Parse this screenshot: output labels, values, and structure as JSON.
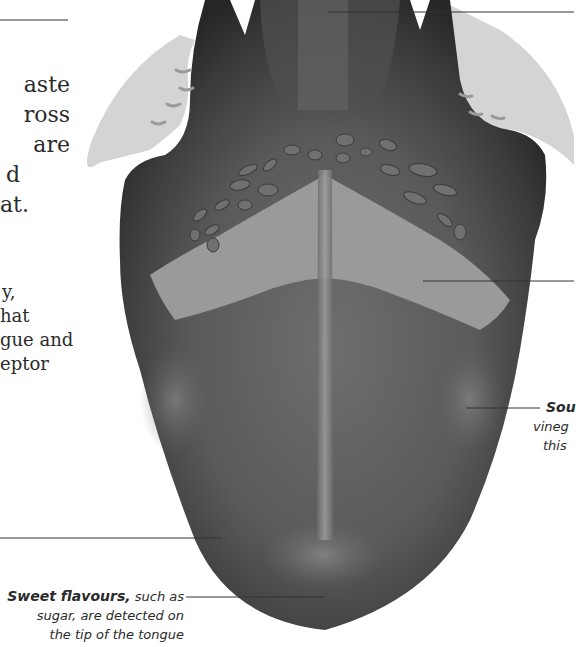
{
  "intro_paragraph": {
    "lines": [
      "aste",
      "ross",
      "are",
      "d",
      "at."
    ]
  },
  "second_paragraph": {
    "lines": [
      "y,",
      "hat",
      "gue and",
      "eptor"
    ]
  },
  "labels": {
    "sour": {
      "lines": [
        "Sou",
        "vineg",
        "this"
      ],
      "bold_term": "Sou"
    },
    "sweet": {
      "bold_term": "Sweet flavours,",
      "rest_line1": " such as",
      "line2": "sugar, are detected on",
      "line3": "the tip of the tongue"
    }
  },
  "illustration": {
    "subject": "tongue-diagram",
    "colors": {
      "tongue_dark": "#3a3a3a",
      "tongue_mid": "#5e5e5e",
      "bitter_zone": "#9a9a9a",
      "tonsil_light": "#d4d4d4",
      "leader_line": "#333333"
    }
  }
}
